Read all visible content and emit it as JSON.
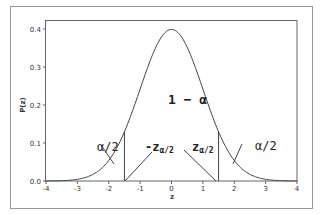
{
  "chart_data": {
    "type": "line",
    "title": "",
    "xlabel": "z",
    "ylabel": "P(z)",
    "xlim": [
      -4,
      4
    ],
    "ylim": [
      0,
      0.42
    ],
    "xticks": [
      "-4",
      "-3",
      "-2",
      "-1",
      "0",
      "1",
      "2",
      "3",
      "4"
    ],
    "yticks": [
      "0.0",
      "0.1",
      "0.2",
      "0.3",
      "0.4"
    ],
    "grid": false,
    "series": [
      {
        "name": "Standard normal density",
        "x": [
          -4,
          -3.5,
          -3,
          -2.5,
          -2,
          -1.5,
          -1,
          -0.5,
          0,
          0.5,
          1,
          1.5,
          2,
          2.5,
          3,
          3.5,
          4
        ],
        "values": [
          0.0001,
          0.0009,
          0.0044,
          0.0175,
          0.054,
          0.1295,
          0.242,
          0.3521,
          0.3989,
          0.3521,
          0.242,
          0.1295,
          0.054,
          0.0175,
          0.0044,
          0.0009,
          0.0001
        ]
      }
    ],
    "critical_values": [
      -1.5,
      1.5
    ],
    "annotations": [
      {
        "text": "1 − α",
        "x": 0.9,
        "y": 0.21
      },
      {
        "text": "α/2",
        "x": -2.1,
        "y": 0.095
      },
      {
        "text": "-zα/2",
        "x": -0.55,
        "y": 0.095
      },
      {
        "text": "zα/2",
        "x": 0.65,
        "y": 0.095
      },
      {
        "text": "α/2",
        "x": 2.65,
        "y": 0.095
      }
    ]
  },
  "labels": {
    "xlabel": "z",
    "ylabel": "P(z)",
    "center": "1 − α",
    "left_tail": "α/2",
    "right_tail": "α/2",
    "neg_crit_main": "-z",
    "crit_main": "z",
    "crit_sub": "α/2"
  }
}
